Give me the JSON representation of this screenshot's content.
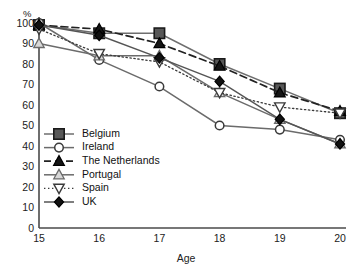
{
  "chart_data": {
    "type": "line",
    "title": "",
    "xlabel": "Age",
    "ylabel": "%",
    "x": [
      15,
      16,
      17,
      18,
      19,
      20
    ],
    "categories": [
      "15",
      "16",
      "17",
      "18",
      "19",
      "20"
    ],
    "xlim": [
      15,
      20
    ],
    "ylim": [
      0,
      100
    ],
    "yticks": [
      0,
      10,
      20,
      30,
      40,
      50,
      60,
      70,
      80,
      90,
      100
    ],
    "ytick_labels": [
      "0",
      "10",
      "20",
      "30",
      "40",
      "50",
      "60",
      "70",
      "80",
      "90",
      "100"
    ],
    "xtick_labels": [
      "15",
      "16",
      "17",
      "18",
      "19",
      "20"
    ],
    "grid": false,
    "legend_position": "inside-lower-left",
    "series": [
      {
        "name": "Belgium",
        "values": [
          99,
          95,
          95,
          80,
          68,
          56
        ],
        "marker": "filled-square",
        "line_style": "solid",
        "color": "#6e6e6e",
        "marker_fill": "#585858",
        "marker_edge": "#1a1a1a"
      },
      {
        "name": "Ireland",
        "values": [
          100,
          82,
          69,
          50,
          48,
          43
        ],
        "marker": "open-circle",
        "line_style": "solid",
        "color": "#6b6b6b",
        "marker_fill": "#ffffff",
        "marker_edge": "#3a3a3a"
      },
      {
        "name": "The Netherlands",
        "values": [
          99,
          97,
          90,
          79,
          66,
          57
        ],
        "marker": "filled-triangle",
        "line_style": "dashed",
        "color": "#222222",
        "marker_fill": "#151515",
        "marker_edge": "#000000"
      },
      {
        "name": "Portugal",
        "values": [
          90,
          84,
          84,
          66,
          53,
          41
        ],
        "marker": "open-triangle",
        "line_style": "solid",
        "color": "#6b6b6b",
        "marker_fill": "#d8d8d8",
        "marker_edge": "#6a6a6a"
      },
      {
        "name": "Spain",
        "values": [
          97,
          85,
          81,
          66,
          59,
          56
        ],
        "marker": "open-down-triangle",
        "line_style": "dotted",
        "color": "#3a3a3a",
        "marker_fill": "#ffffff",
        "marker_edge": "#3a3a3a"
      },
      {
        "name": "UK",
        "values": [
          99,
          94,
          83,
          71.5,
          53,
          41
        ],
        "marker": "filled-diamond",
        "line_style": "solid",
        "color": "#555555",
        "marker_fill": "#111111",
        "marker_edge": "#000000"
      }
    ]
  },
  "legend": {
    "items": [
      {
        "label": "Belgium"
      },
      {
        "label": "Ireland"
      },
      {
        "label": "The Netherlands"
      },
      {
        "label": "Portugal"
      },
      {
        "label": "Spain"
      },
      {
        "label": "UK"
      }
    ]
  }
}
